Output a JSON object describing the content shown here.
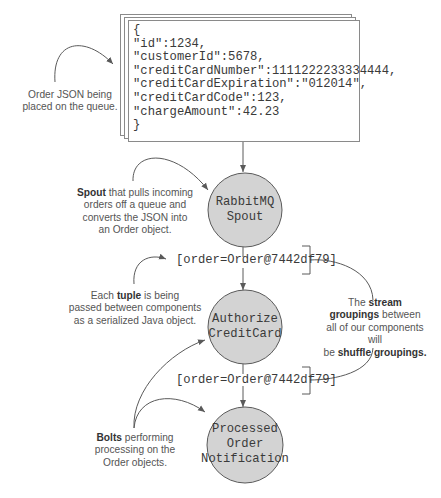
{
  "json_card": {
    "lines": [
      "{",
      "\"id\":1234,",
      "\"customerId\":5678,",
      "\"creditCardNumber\":1111222233334444,",
      "\"creditCardExpiration\":\"012014\",",
      "\"creditCardCode\":123,",
      "\"chargeAmount\":42.23",
      "}"
    ]
  },
  "annotations": {
    "order_json": [
      "Order JSON being",
      "placed on the queue."
    ],
    "spout": {
      "bold": "Spout",
      "rest_first": " that pulls incoming",
      "lines": [
        "orders off a queue and",
        "converts the JSON into",
        "an Order object."
      ]
    },
    "tuple": {
      "pre": "Each ",
      "bold": "tuple",
      "post": " is being",
      "lines": [
        "passed between components",
        "as a serialized Java object."
      ]
    },
    "groupings": {
      "line1_pre": "The ",
      "line1_bold": "stream",
      "line2_bold": "groupings",
      "line2_post": " between",
      "line3": "all of our components will",
      "line4_pre": "be ",
      "line4_bold": "shuffle groupings."
    },
    "bolts": {
      "bold": "Bolts",
      "rest_first": " performing",
      "lines": [
        "processing on the",
        "Order objects."
      ]
    }
  },
  "nodes": [
    {
      "id": "spout",
      "lines": [
        "RabbitMQ",
        "Spout"
      ]
    },
    {
      "id": "authorize",
      "lines": [
        "Authorize",
        "CreditCard"
      ]
    },
    {
      "id": "notification",
      "lines": [
        "Processed",
        "Order",
        "Notification"
      ]
    }
  ],
  "tuples": [
    {
      "label": "[order=Order@7442df79]"
    },
    {
      "label": "[order=Order@7442df79]"
    }
  ],
  "colors": {
    "node_fill": "#d3d3d3",
    "stroke": "#5a5a5a",
    "card_border": "#8a8a8a",
    "text": "#3a3a3a"
  }
}
